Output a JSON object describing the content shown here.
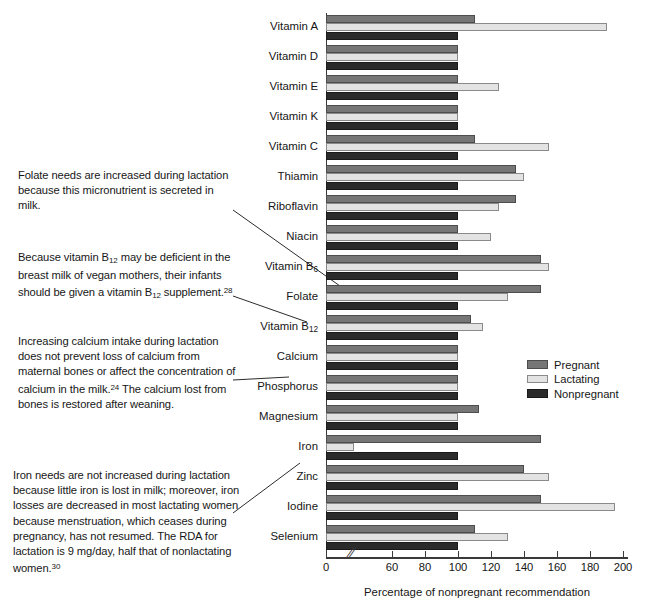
{
  "chart_data": {
    "type": "bar",
    "orientation": "horizontal",
    "title": "",
    "xlabel": "Percentage of nonpregnant recommendation",
    "ylabel": "",
    "xlim": [
      0,
      200
    ],
    "axis_break": true,
    "axis_break_symbol": "//",
    "grid": false,
    "legend_position": "middle-right",
    "tick_labels": [
      "0",
      "60",
      "80",
      "100",
      "120",
      "140",
      "160",
      "180",
      "200"
    ],
    "tick_values": [
      0,
      60,
      80,
      100,
      120,
      140,
      160,
      180,
      200
    ],
    "categories": [
      "Vitamin A",
      "Vitamin D",
      "Vitamin E",
      "Vitamin K",
      "Vitamin C",
      "Thiamin",
      "Riboflavin",
      "Niacin",
      "Vitamin B₆",
      "Folate",
      "Vitamin B₁₂",
      "Calcium",
      "Phosphorus",
      "Magnesium",
      "Iron",
      "Zinc",
      "Iodine",
      "Selenium"
    ],
    "categories_rich": [
      {
        "text": "Vitamin A",
        "sub": ""
      },
      {
        "text": "Vitamin D",
        "sub": ""
      },
      {
        "text": "Vitamin E",
        "sub": ""
      },
      {
        "text": "Vitamin K",
        "sub": ""
      },
      {
        "text": "Vitamin C",
        "sub": ""
      },
      {
        "text": "Thiamin",
        "sub": ""
      },
      {
        "text": "Riboflavin",
        "sub": ""
      },
      {
        "text": "Niacin",
        "sub": ""
      },
      {
        "text": "Vitamin B",
        "sub": "6"
      },
      {
        "text": "Folate",
        "sub": ""
      },
      {
        "text": "Vitamin B",
        "sub": "12"
      },
      {
        "text": "Calcium",
        "sub": ""
      },
      {
        "text": "Phosphorus",
        "sub": ""
      },
      {
        "text": "Magnesium",
        "sub": ""
      },
      {
        "text": "Iron",
        "sub": ""
      },
      {
        "text": "Zinc",
        "sub": ""
      },
      {
        "text": "Iodine",
        "sub": ""
      },
      {
        "text": "Selenium",
        "sub": ""
      }
    ],
    "series": [
      {
        "name": "Pregnant",
        "color": "#767676",
        "values": [
          110,
          100,
          100,
          100,
          110,
          135,
          135,
          100,
          150,
          150,
          108,
          100,
          100,
          113,
          150,
          140,
          150,
          110
        ]
      },
      {
        "name": "Lactating",
        "color": "#e3e3e3",
        "values": [
          190,
          100,
          125,
          100,
          155,
          140,
          125,
          120,
          155,
          130,
          115,
          100,
          100,
          100,
          35,
          155,
          195,
          130
        ]
      },
      {
        "name": "Nonpregnant",
        "color": "#2b2b2b",
        "values": [
          100,
          100,
          100,
          100,
          100,
          100,
          100,
          100,
          100,
          100,
          100,
          100,
          100,
          100,
          100,
          100,
          100,
          100
        ]
      }
    ]
  },
  "legend": {
    "items": [
      {
        "label": "Pregnant",
        "swatch": "pregnant"
      },
      {
        "label": "Lactating",
        "swatch": "lactating"
      },
      {
        "label": "Nonpregnant",
        "swatch": "nonpregnant"
      }
    ]
  },
  "annotations": [
    {
      "id": "folate",
      "parts": [
        {
          "t": "Folate needs are increased during lactation because this micronutrient is secreted in milk."
        }
      ]
    },
    {
      "id": "b12",
      "parts": [
        {
          "t": "Because vitamin B"
        },
        {
          "sub": "12"
        },
        {
          "t": " may be deficient in the breast milk of vegan mothers, their infants should be given a vitamin B"
        },
        {
          "sub": "12"
        },
        {
          "t": " supplement."
        },
        {
          "sup": "28"
        }
      ]
    },
    {
      "id": "calcium",
      "parts": [
        {
          "t": "Increasing calcium intake during lactation does not prevent loss of calcium from maternal bones or affect the concentration of calcium in the milk."
        },
        {
          "sup": "24"
        },
        {
          "t": " The calcium lost from bones is restored after weaning."
        }
      ]
    },
    {
      "id": "iron",
      "parts": [
        {
          "t": "Iron needs are not increased during lactation because little iron is lost in milk; moreover, iron losses are decreased in most lactating women because menstruation, which ceases during pregnancy, has not resumed. The RDA for lactation is 9 mg/day, half that of nonlactating women."
        },
        {
          "sup": "30"
        }
      ]
    }
  ],
  "leader_lines": [
    {
      "name": "leader-folate",
      "from": [
        233,
        210
      ],
      "to": [
        347,
        291
      ]
    },
    {
      "name": "leader-b12",
      "from": [
        233,
        296
      ],
      "to": [
        307,
        322
      ]
    },
    {
      "name": "leader-calcium",
      "from": [
        233,
        380
      ],
      "to": [
        289,
        377
      ]
    },
    {
      "name": "leader-iron",
      "from": [
        233,
        513
      ],
      "to": [
        300,
        463
      ]
    }
  ]
}
